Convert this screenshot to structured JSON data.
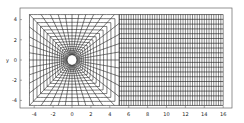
{
  "chart_data": {
    "type": "mesh",
    "title": "",
    "xlabel": "",
    "ylabel": "y",
    "xlim": [
      -5,
      16.5
    ],
    "ylim": [
      -4.6,
      4.6
    ],
    "xticks": [
      -4,
      -2,
      0,
      2,
      4,
      6,
      8,
      10,
      12,
      14,
      16
    ],
    "yticks": [
      -4,
      -2,
      0,
      2,
      4
    ],
    "grid": false,
    "cylinder": {
      "center": [
        0,
        0
      ],
      "radius": 0.5
    },
    "near_field": {
      "x_range": [
        -4.5,
        5
      ],
      "y_range": [
        -4.5,
        4.5
      ],
      "radial_lines": 40,
      "rings": 16
    },
    "wake_field": {
      "x_range": [
        5,
        16
      ],
      "y_range": [
        -4.5,
        4.5
      ],
      "columns": 44,
      "rows": 19
    }
  },
  "axes": {
    "ylabel": "y",
    "xtick_labels": [
      "-4",
      "-2",
      "0",
      "2",
      "4",
      "6",
      "8",
      "10",
      "12",
      "14",
      "16"
    ],
    "ytick_labels": [
      "4",
      "2",
      "0",
      "-2",
      "-4"
    ]
  },
  "colors": {
    "line": "#111111",
    "frame": "#555555",
    "background": "#ffffff"
  }
}
